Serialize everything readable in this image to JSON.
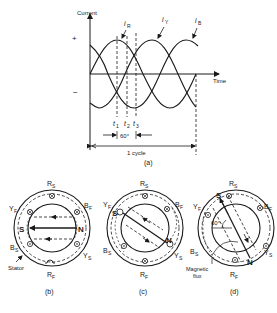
{
  "figure_a": {
    "y_axis_label": "Current",
    "x_axis_label": "Time",
    "plus_sign": "+",
    "minus_sign": "−",
    "curves": [
      {
        "name": "i_R",
        "label_main": "i",
        "label_sub": "R",
        "phase_deg": 0
      },
      {
        "name": "i_Y",
        "label_main": "i",
        "label_sub": "Y",
        "phase_deg": -120
      },
      {
        "name": "i_B",
        "label_main": "i",
        "label_sub": "B",
        "phase_deg": -240
      }
    ],
    "time_markers": [
      {
        "main": "t",
        "sub": "1"
      },
      {
        "main": "t",
        "sub": "2"
      },
      {
        "main": "t",
        "sub": "3"
      }
    ],
    "interval_label": "60°",
    "cycle_label": "1 cycle",
    "caption": "(a)"
  },
  "figure_b": {
    "labels": {
      "top": "R",
      "top_sub": "S",
      "bottom": "R",
      "bottom_sub": "F",
      "upper_left": "Y",
      "upper_left_sub": "F",
      "upper_right": "B",
      "upper_right_sub": "F",
      "lower_left": "B",
      "lower_left_sub": "S",
      "lower_right": "Y",
      "lower_right_sub": "S"
    },
    "pole_south": "S",
    "pole_north": "N",
    "annotation": "Stator",
    "caption": "(b)"
  },
  "figure_c": {
    "labels": {
      "top": "R",
      "top_sub": "S",
      "bottom": "R",
      "bottom_sub": "F",
      "upper_left": "Y",
      "upper_left_sub": "F",
      "upper_right": "B",
      "upper_right_sub": "F",
      "lower_left": "B",
      "lower_left_sub": "S",
      "lower_right": "Y",
      "lower_right_sub": "S"
    },
    "pole_south": "S",
    "pole_north": "N",
    "caption": "(c)"
  },
  "figure_d": {
    "labels": {
      "top": "R",
      "top_sub": "S",
      "bottom": "R",
      "bottom_sub": "F",
      "upper_left": "Y",
      "upper_left_sub": "F",
      "upper_right": "B",
      "upper_right_sub": "F",
      "lower_left": "B",
      "lower_left_sub": "S",
      "lower_right": "Y",
      "lower_right_sub": "S"
    },
    "pole_south": "S",
    "pole_north": "N",
    "angle_label": "60°",
    "annotation_line1": "Magnetic",
    "annotation_line2": "flux",
    "caption": "(d)"
  }
}
